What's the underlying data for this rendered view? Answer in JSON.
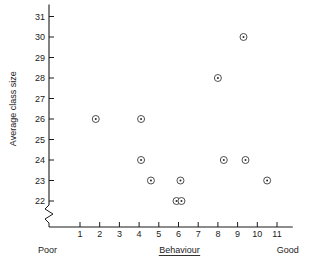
{
  "chart_data": {
    "type": "scatter",
    "title": "",
    "xlabel": "Behaviour",
    "ylabel": "Average class size",
    "xlim": [
      0,
      11.8
    ],
    "ylim": [
      21.6,
      31.5
    ],
    "grid": false,
    "legend": null,
    "y_axis_break": true,
    "x_ticks": [
      1,
      2,
      3,
      4,
      5,
      6,
      7,
      8,
      9,
      10,
      11
    ],
    "x_tick_labels": [
      "1",
      "2",
      "3",
      "4",
      "5",
      "6",
      "7",
      "8",
      "9",
      "10",
      "11"
    ],
    "y_ticks": [
      22,
      23,
      24,
      25,
      26,
      27,
      28,
      29,
      30,
      31
    ],
    "y_tick_labels": [
      "22",
      "23",
      "24",
      "25",
      "26",
      "27",
      "28",
      "29",
      "30",
      "31"
    ],
    "x_anchor_low": "Poor",
    "x_anchor_high": "Good",
    "points": [
      {
        "x": 1.8,
        "y": 26
      },
      {
        "x": 4.1,
        "y": 26
      },
      {
        "x": 4.1,
        "y": 24
      },
      {
        "x": 4.6,
        "y": 23
      },
      {
        "x": 5.9,
        "y": 22
      },
      {
        "x": 6.15,
        "y": 22
      },
      {
        "x": 6.1,
        "y": 23
      },
      {
        "x": 8.0,
        "y": 28
      },
      {
        "x": 8.3,
        "y": 24
      },
      {
        "x": 9.3,
        "y": 30
      },
      {
        "x": 9.4,
        "y": 24
      },
      {
        "x": 10.5,
        "y": 23
      }
    ]
  },
  "axis": {
    "x_title": "Behaviour",
    "y_title": "Average class size",
    "anchor_low": "Poor",
    "anchor_high": "Good"
  }
}
